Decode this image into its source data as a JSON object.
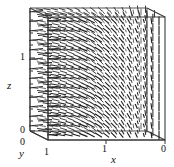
{
  "figure": {
    "kind": "3d-director-field-box",
    "background": "#ffffff",
    "ink": "#1a1a1a",
    "box_edge_color": "#3a3a3a",
    "dash_color": "#222222"
  },
  "axes": {
    "x": {
      "label": "x",
      "ticks": [
        {
          "value": "1",
          "pos": 0.5
        },
        {
          "value": "0",
          "pos": 1.0
        }
      ],
      "range": [
        0,
        1
      ],
      "direction": "right-to-left-decreasing"
    },
    "y": {
      "label": "y",
      "ticks": [
        {
          "value": "0",
          "pos": 0.0
        },
        {
          "value": "1",
          "pos": 1.0
        }
      ],
      "range": [
        0,
        1
      ],
      "direction": "depth"
    },
    "z": {
      "label": "z",
      "ticks": [
        {
          "value": "0",
          "pos": 0.0
        },
        {
          "value": "1",
          "pos": 0.72
        }
      ],
      "range": [
        0,
        1.4
      ],
      "direction": "up"
    }
  },
  "chart_data": {
    "type": "scatter",
    "title": "",
    "xlabel": "x",
    "ylabel": "z",
    "zlabel": "y",
    "grid": false,
    "legend": null,
    "rows": 13,
    "cols": 15,
    "angle_rule_deg": {
      "left": 8,
      "right": 90
    },
    "xlim": [
      0,
      1
    ],
    "ylim": [
      0,
      1.4
    ]
  },
  "ticklabels": {
    "z_one": "1",
    "z_zero": "0",
    "y_zero": "0",
    "y_one": "1",
    "x_one": "1",
    "x_zero": "0"
  },
  "labels": {
    "x": "x",
    "y": "y",
    "z": "z"
  }
}
